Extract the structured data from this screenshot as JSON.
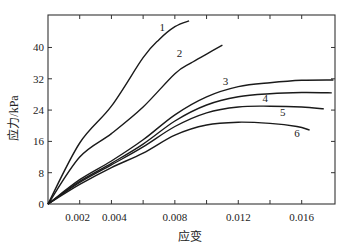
{
  "chart_data": {
    "type": "line",
    "title": "",
    "xlabel": "应变",
    "ylabel": "应力/kPa",
    "xlim": [
      0,
      0.0181
    ],
    "ylim": [
      0,
      48.3
    ],
    "x_ticks": [
      0.002,
      0.004,
      0.006,
      0.008,
      0.01,
      0.012,
      0.014,
      0.016
    ],
    "x_tick_labels": [
      "0.002",
      "0.004",
      "",
      "0.008",
      "",
      "0.012",
      "",
      "0.016"
    ],
    "y_ticks": [
      0,
      8,
      16,
      24,
      32,
      40
    ],
    "y_tick_labels": [
      "0",
      "8",
      "16",
      "24",
      "32",
      "40"
    ],
    "grid": false,
    "legend": "inline numeric labels",
    "series": [
      {
        "name": "1",
        "label_pos": [
          0.0072,
          44.2
        ],
        "points": [
          [
            0,
            0
          ],
          [
            0.002,
            15.6
          ],
          [
            0.004,
            25.0
          ],
          [
            0.006,
            37.4
          ],
          [
            0.007,
            42.0
          ],
          [
            0.008,
            45.3
          ],
          [
            0.0089,
            46.8
          ]
        ]
      },
      {
        "name": "2",
        "label_pos": [
          0.0083,
          37.5
        ],
        "points": [
          [
            0,
            0
          ],
          [
            0.002,
            12.0
          ],
          [
            0.004,
            18.0
          ],
          [
            0.006,
            24.8
          ],
          [
            0.008,
            33.3
          ],
          [
            0.009,
            36.0
          ],
          [
            0.01,
            38.3
          ],
          [
            0.011,
            40.6
          ]
        ]
      },
      {
        "name": "3",
        "label_pos": [
          0.0112,
          30.4
        ],
        "points": [
          [
            0,
            0
          ],
          [
            0.002,
            6.2
          ],
          [
            0.004,
            11.0
          ],
          [
            0.006,
            16.4
          ],
          [
            0.008,
            22.8
          ],
          [
            0.01,
            27.4
          ],
          [
            0.012,
            30.0
          ],
          [
            0.014,
            31.0
          ],
          [
            0.016,
            31.6
          ],
          [
            0.018,
            31.7
          ]
        ]
      },
      {
        "name": "4",
        "label_pos": [
          0.0137,
          26.1
        ],
        "points": [
          [
            0,
            0
          ],
          [
            0.002,
            5.8
          ],
          [
            0.004,
            10.4
          ],
          [
            0.006,
            15.3
          ],
          [
            0.008,
            21.2
          ],
          [
            0.01,
            25.3
          ],
          [
            0.012,
            27.4
          ],
          [
            0.014,
            28.2
          ],
          [
            0.016,
            28.5
          ],
          [
            0.0179,
            28.4
          ]
        ]
      },
      {
        "name": "5",
        "label_pos": [
          0.0148,
          22.6
        ],
        "points": [
          [
            0,
            0
          ],
          [
            0.002,
            5.5
          ],
          [
            0.004,
            10.0
          ],
          [
            0.006,
            14.6
          ],
          [
            0.008,
            19.8
          ],
          [
            0.01,
            23.3
          ],
          [
            0.012,
            24.8
          ],
          [
            0.014,
            25.0
          ],
          [
            0.016,
            24.8
          ],
          [
            0.0174,
            24.3
          ]
        ]
      },
      {
        "name": "6",
        "label_pos": [
          0.0157,
          17.0
        ],
        "points": [
          [
            0,
            0
          ],
          [
            0.002,
            5.0
          ],
          [
            0.004,
            9.3
          ],
          [
            0.006,
            13.0
          ],
          [
            0.008,
            17.6
          ],
          [
            0.01,
            20.2
          ],
          [
            0.012,
            20.9
          ],
          [
            0.014,
            20.6
          ],
          [
            0.0157,
            19.8
          ],
          [
            0.0165,
            18.9
          ]
        ]
      }
    ]
  }
}
